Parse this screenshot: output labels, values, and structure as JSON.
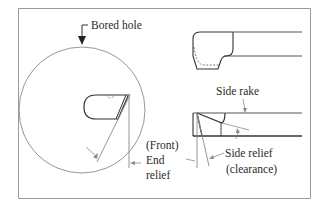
{
  "diagram": {
    "type": "engineering-drawing",
    "frame": {
      "stroke": "#9a9a9a"
    },
    "labels": {
      "bored_hole": "Bored hole",
      "side_rake": "Side rake",
      "front": "(Front)",
      "end": "End",
      "relief": "relief",
      "side_relief": "Side relief",
      "clearance": "(clearance)"
    },
    "views": [
      {
        "name": "end-view",
        "description": "Tool tip inside bored hole circle"
      },
      {
        "name": "top-view",
        "description": "Tool shank with bit, top"
      },
      {
        "name": "side-view",
        "description": "Tool shank with side rake and side relief"
      }
    ],
    "colors": {
      "line": "#333333",
      "thin_line": "#8a8a8a",
      "text": "#2a2a2a"
    }
  }
}
